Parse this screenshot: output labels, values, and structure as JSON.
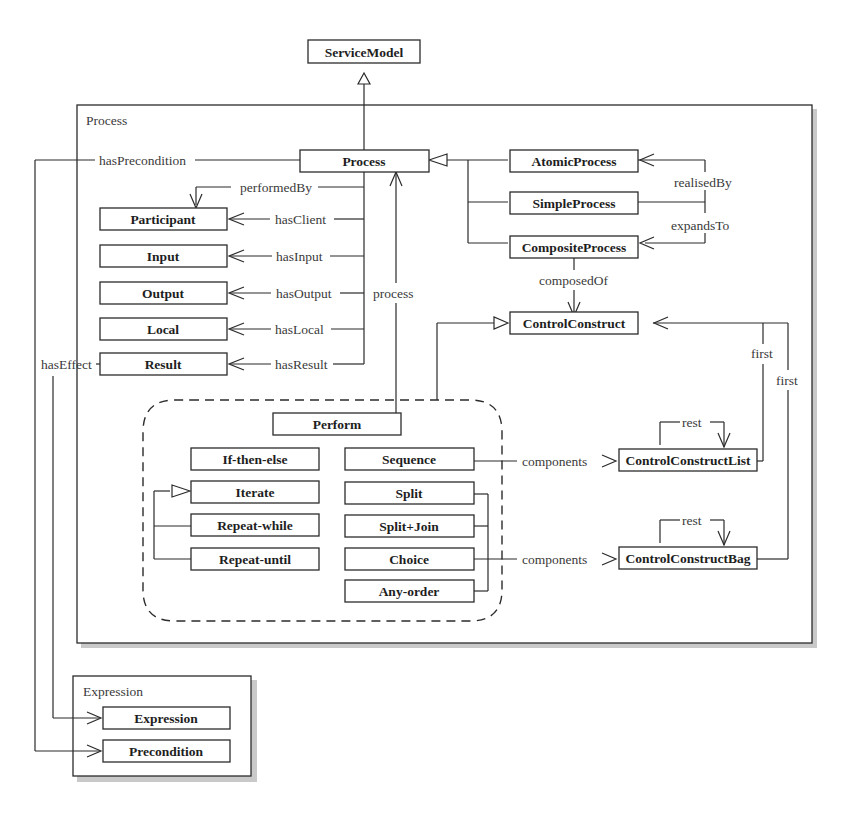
{
  "top": {
    "service_model": "ServiceModel"
  },
  "process_frame": {
    "title": "Process",
    "classes": {
      "process": "Process",
      "participant": "Participant",
      "input": "Input",
      "output": "Output",
      "local": "Local",
      "result": "Result",
      "atomic_process": "AtomicProcess",
      "simple_process": "SimpleProcess",
      "composite_process": "CompositeProcess",
      "control_construct": "ControlConstruct",
      "control_construct_list": "ControlConstructList",
      "control_construct_bag": "ControlConstructBag",
      "perform": "Perform",
      "if_then_else": "If-then-else",
      "iterate": "Iterate",
      "repeat_while": "Repeat-while",
      "repeat_until": "Repeat-until",
      "sequence": "Sequence",
      "split": "Split",
      "split_join": "Split+Join",
      "choice": "Choice",
      "any_order": "Any-order"
    },
    "relations": {
      "has_precondition": "hasPrecondition",
      "performed_by": "performedBy",
      "has_client": "hasClient",
      "has_input": "hasInput",
      "has_output": "hasOutput",
      "has_local": "hasLocal",
      "has_result": "hasResult",
      "has_effect": "hasEffect",
      "process": "process",
      "realised_by": "realisedBy",
      "expands_to": "expandsTo",
      "composed_of": "composedOf",
      "first_list": "first",
      "first_bag": "first",
      "rest_list": "rest",
      "rest_bag": "rest",
      "components_list": "components",
      "components_bag": "components"
    }
  },
  "expression_frame": {
    "title": "Expression",
    "classes": {
      "expression": "Expression",
      "precondition": "Precondition"
    }
  }
}
